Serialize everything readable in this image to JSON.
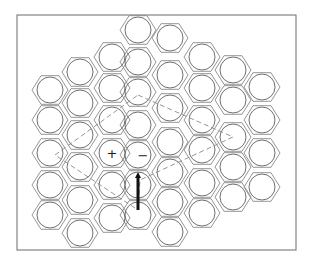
{
  "diagram": {
    "frame": {
      "x": 17,
      "y": 15,
      "w": 279,
      "h": 235
    },
    "atom_radius": 13,
    "atoms": [
      [
        50,
        90
      ],
      [
        50,
        120
      ],
      [
        50,
        153
      ],
      [
        50,
        185
      ],
      [
        50,
        215
      ],
      [
        80,
        72
      ],
      [
        80,
        103
      ],
      [
        80,
        135
      ],
      [
        80,
        167
      ],
      [
        80,
        200
      ],
      [
        80,
        233
      ],
      [
        112,
        57
      ],
      [
        112,
        88
      ],
      [
        112,
        120
      ],
      [
        112,
        153
      ],
      [
        112,
        185
      ],
      [
        112,
        218
      ],
      [
        138,
        30
      ],
      [
        138,
        62
      ],
      [
        138,
        92
      ],
      [
        138,
        125
      ],
      [
        138,
        155
      ],
      [
        138,
        185
      ],
      [
        138,
        215
      ],
      [
        170,
        38
      ],
      [
        170,
        75
      ],
      [
        170,
        108
      ],
      [
        170,
        142
      ],
      [
        170,
        172
      ],
      [
        170,
        202
      ],
      [
        170,
        232
      ],
      [
        202,
        57
      ],
      [
        202,
        88
      ],
      [
        202,
        120
      ],
      [
        202,
        150
      ],
      [
        202,
        183
      ],
      [
        202,
        213
      ],
      [
        233,
        70
      ],
      [
        233,
        100
      ],
      [
        233,
        137
      ],
      [
        233,
        167
      ],
      [
        233,
        197
      ],
      [
        262,
        87
      ],
      [
        262,
        120
      ],
      [
        262,
        153
      ],
      [
        262,
        187
      ]
    ],
    "charges": [
      {
        "label": "+",
        "x": 112,
        "y": 153,
        "name": "positive-charge"
      },
      {
        "label": "−",
        "x": 143,
        "y": 155,
        "name": "negative-charge"
      }
    ],
    "burgers_circuit": [
      [
        138,
        95
      ],
      [
        233,
        137
      ],
      [
        140,
        180
      ],
      [
        138,
        210
      ],
      [
        55,
        155
      ],
      [
        138,
        95
      ]
    ],
    "arrow": {
      "x": 138,
      "y1": 210,
      "y2": 172,
      "color": "#111111"
    },
    "colors": {
      "line": "#8a8a8a",
      "atom": "#707070",
      "background": "#ffffff"
    }
  }
}
